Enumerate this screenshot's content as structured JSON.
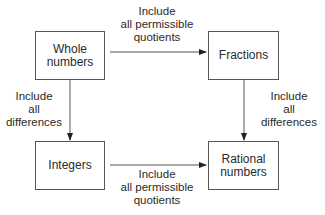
{
  "nodes": {
    "whole_numbers": {
      "line1": "Whole",
      "line2": "numbers"
    },
    "fractions": {
      "line1": "Fractions"
    },
    "integers": {
      "line1": "Integers"
    },
    "rational_numbers": {
      "line1": "Rational",
      "line2": "numbers"
    }
  },
  "edges": {
    "top": {
      "from": "Whole numbers",
      "to": "Fractions",
      "line1": "Include",
      "line2": "all permissible",
      "line3": "quotients"
    },
    "bottom": {
      "from": "Integers",
      "to": "Rational numbers",
      "line1": "Include",
      "line2": "all permissible",
      "line3": "quotients"
    },
    "left": {
      "from": "Whole numbers",
      "to": "Integers",
      "line1": "Include",
      "line2": "all",
      "line3": "differences"
    },
    "right": {
      "from": "Fractions",
      "to": "Rational numbers",
      "line1": "Include",
      "line2": "all",
      "line3": "differences"
    }
  },
  "colors": {
    "line": "#555555",
    "text": "#2a2a2a",
    "background": "#ffffff"
  }
}
